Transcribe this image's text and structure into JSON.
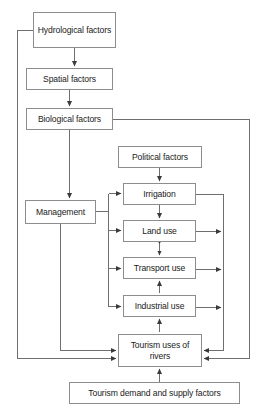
{
  "diagram": {
    "type": "flowchart",
    "canvas": {
      "width": 262,
      "height": 413
    },
    "style": {
      "box_border_color": "#8d8d8d",
      "box_fill_color": "#ffffff",
      "line_color": "#6f6f6f",
      "text_color": "#1a1a1a",
      "background_color": "#ffffff"
    },
    "nodes": [
      {
        "id": "hydrological",
        "label": "Hydrological factors",
        "x": 33,
        "y": 12,
        "w": 83,
        "h": 36
      },
      {
        "id": "spatial",
        "label": "Spatial factors",
        "x": 26,
        "y": 68,
        "w": 87,
        "h": 22
      },
      {
        "id": "biological",
        "label": "Biological factors",
        "x": 26,
        "y": 108,
        "w": 87,
        "h": 22
      },
      {
        "id": "management",
        "label": "Management",
        "x": 25,
        "y": 200,
        "w": 71,
        "h": 24
      },
      {
        "id": "political",
        "label": "Political factors",
        "x": 118,
        "y": 146,
        "w": 84,
        "h": 22
      },
      {
        "id": "irrigation",
        "label": "Irrigation",
        "x": 123,
        "y": 183,
        "w": 73,
        "h": 22
      },
      {
        "id": "land_use",
        "label": "Land use",
        "x": 123,
        "y": 220,
        "w": 73,
        "h": 22
      },
      {
        "id": "transport_use",
        "label": "Transport use",
        "x": 123,
        "y": 257,
        "w": 73,
        "h": 22
      },
      {
        "id": "industrial_use",
        "label": "Industrial use",
        "x": 123,
        "y": 295,
        "w": 73,
        "h": 22
      },
      {
        "id": "tourism_uses",
        "label": "Tourism uses of rivers",
        "x": 118,
        "y": 334,
        "w": 84,
        "h": 33
      },
      {
        "id": "tourism_demand",
        "label": "Tourism demand and supply factors",
        "x": 69,
        "y": 382,
        "w": 171,
        "h": 22
      }
    ],
    "edges": [
      {
        "from": "hydrological",
        "to": "spatial",
        "arrow": "single"
      },
      {
        "from": "spatial",
        "to": "biological",
        "arrow": "single"
      },
      {
        "from": "biological",
        "to": "management",
        "arrow": "single"
      },
      {
        "from": "hydrological",
        "to": "management",
        "arrow": "single",
        "route": "left-bus"
      },
      {
        "from": "biological",
        "to": "tourism_uses",
        "arrow": "single",
        "route": "right-outer-bus"
      },
      {
        "from": "political",
        "to": "irrigation",
        "arrow": "single"
      },
      {
        "from": "management",
        "to": "irrigation",
        "arrow": "single",
        "route": "center-bus"
      },
      {
        "from": "management",
        "to": "land_use",
        "arrow": "single",
        "route": "center-bus"
      },
      {
        "from": "management",
        "to": "transport_use",
        "arrow": "single",
        "route": "center-bus"
      },
      {
        "from": "management",
        "to": "industrial_use",
        "arrow": "single",
        "route": "center-bus"
      },
      {
        "from": "management",
        "to": "tourism_uses",
        "arrow": "single",
        "route": "bottom-left"
      },
      {
        "from": "irrigation",
        "to": "land_use",
        "arrow": "single"
      },
      {
        "from": "land_use",
        "to": "transport_use",
        "arrow": "double"
      },
      {
        "from": "industrial_use",
        "to": "transport_use",
        "arrow": "single"
      },
      {
        "from": "tourism_uses",
        "to": "industrial_use",
        "arrow": "single"
      },
      {
        "from": "tourism_demand",
        "to": "tourism_uses",
        "arrow": "single"
      },
      {
        "from": "irrigation",
        "to": "tourism_uses",
        "arrow": "single",
        "route": "right-inner-bus"
      },
      {
        "from": "land_use",
        "to": "tourism_uses",
        "arrow": "single",
        "route": "right-inner-bus"
      },
      {
        "from": "transport_use",
        "to": "tourism_uses",
        "arrow": "single",
        "route": "right-inner-bus"
      },
      {
        "from": "industrial_use",
        "to": "tourism_uses",
        "arrow": "single",
        "route": "right-inner-bus"
      }
    ]
  }
}
